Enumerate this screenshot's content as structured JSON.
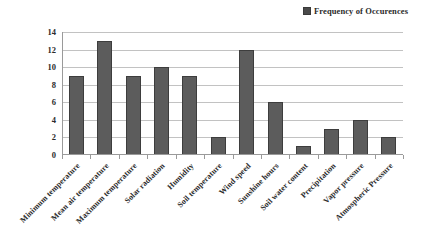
{
  "legend": {
    "marker": "legend-swatch",
    "label": "Frequency of Occurences"
  },
  "axis": {
    "y_ticks": [
      "14",
      "12",
      "10",
      "8",
      "6",
      "4",
      "2",
      "0"
    ]
  },
  "chart_data": {
    "type": "bar",
    "title": "",
    "xlabel": "",
    "ylabel": "",
    "ylim": [
      0,
      14
    ],
    "ytick_step": 2,
    "grid": true,
    "legend_position": "top-right",
    "series_name": "Frequency of Occurences",
    "bar_color": "#5c5c5c",
    "bar_edge_color": "#3d3d3d",
    "grid_color": "#c2c2c2",
    "axis_color": "#9a9a9a",
    "categories": [
      "Minimum temperature",
      "Mean air temperature",
      "Maximum temperature",
      "Solar radiation",
      "Humidity",
      "Soil temperature",
      "Wind speed",
      "Sunshine hours",
      "Soil water content",
      "Precipitation",
      "Vapor pressure",
      "Atmospheric Pressure"
    ],
    "values": [
      9,
      13,
      9,
      10,
      9,
      2,
      12,
      6,
      1,
      3,
      4,
      2
    ]
  }
}
